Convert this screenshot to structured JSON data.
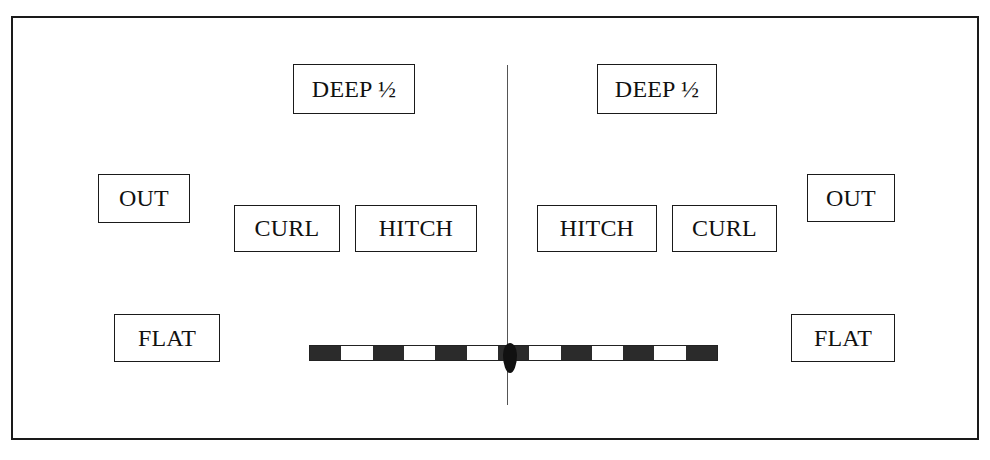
{
  "diagram": {
    "type": "football-passing-route-concept",
    "left_side": {
      "deep": "DEEP ½",
      "out": "OUT",
      "curl": "CURL",
      "hitch": "HITCH",
      "flat": "FLAT"
    },
    "right_side": {
      "deep": "DEEP ½",
      "out": "OUT",
      "curl": "CURL",
      "hitch": "HITCH",
      "flat": "FLAT"
    },
    "line_of_scrimmage": {
      "segments": [
        "dark",
        "light",
        "dark",
        "light",
        "dark",
        "light",
        "dark",
        "light",
        "dark",
        "light",
        "dark",
        "light",
        "dark"
      ]
    },
    "colors": {
      "border": "#1a1a1a",
      "background": "#ffffff",
      "center_line": "#555555",
      "ball": "#111111"
    }
  }
}
